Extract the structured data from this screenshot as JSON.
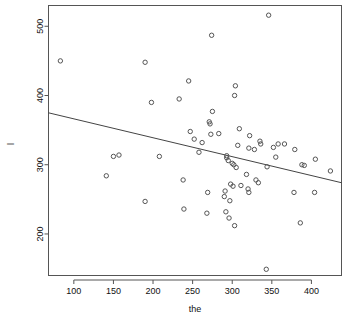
{
  "chart_data": {
    "type": "scatter",
    "title": "",
    "xlabel": "the",
    "ylabel": "l",
    "xlim": [
      68,
      438
    ],
    "ylim": [
      140,
      530
    ],
    "grid": false,
    "legend": null,
    "xticks": [
      100,
      150,
      200,
      250,
      300,
      350,
      400
    ],
    "yticks": [
      200,
      300,
      400,
      500
    ],
    "xticklabels": [
      "100",
      "150",
      "200",
      "250",
      "300",
      "350",
      "400"
    ],
    "yticklabels": [
      "200",
      "300",
      "400",
      "500"
    ],
    "marker": "open-circle",
    "marker_color": "#555555",
    "line_color": "#444444",
    "axis_color": "#555555",
    "series": [
      {
        "name": "observations",
        "points": [
          [
            83,
            450
          ],
          [
            141,
            284
          ],
          [
            150,
            312
          ],
          [
            157,
            314
          ],
          [
            190,
            448
          ],
          [
            190,
            247
          ],
          [
            198,
            390
          ],
          [
            208,
            312
          ],
          [
            233,
            395
          ],
          [
            238,
            278
          ],
          [
            239,
            236
          ],
          [
            245,
            421
          ],
          [
            247,
            348
          ],
          [
            252,
            337
          ],
          [
            258,
            318
          ],
          [
            262,
            332
          ],
          [
            268,
            230
          ],
          [
            269,
            260
          ],
          [
            271,
            362
          ],
          [
            272,
            359
          ],
          [
            273,
            344
          ],
          [
            274,
            487
          ],
          [
            275,
            377
          ],
          [
            283,
            345
          ],
          [
            290,
            254
          ],
          [
            291,
            262
          ],
          [
            292,
            232
          ],
          [
            293,
            313
          ],
          [
            293,
            310
          ],
          [
            295,
            306
          ],
          [
            296,
            223
          ],
          [
            297,
            248
          ],
          [
            298,
            272
          ],
          [
            300,
            302
          ],
          [
            301,
            269
          ],
          [
            302,
            300
          ],
          [
            303,
            400
          ],
          [
            303,
            212
          ],
          [
            304,
            414
          ],
          [
            305,
            296
          ],
          [
            307,
            328
          ],
          [
            309,
            352
          ],
          [
            311,
            270
          ],
          [
            318,
            286
          ],
          [
            320,
            265
          ],
          [
            321,
            324
          ],
          [
            321,
            260
          ],
          [
            322,
            342
          ],
          [
            328,
            322
          ],
          [
            330,
            278
          ],
          [
            333,
            274
          ],
          [
            335,
            334
          ],
          [
            336,
            330
          ],
          [
            343,
            149
          ],
          [
            344,
            297
          ],
          [
            346,
            516
          ],
          [
            352,
            325
          ],
          [
            355,
            311
          ],
          [
            358,
            330
          ],
          [
            366,
            330
          ],
          [
            378,
            260
          ],
          [
            379,
            322
          ],
          [
            386,
            216
          ],
          [
            388,
            300
          ],
          [
            391,
            299
          ],
          [
            404,
            260
          ],
          [
            405,
            308
          ],
          [
            424,
            291
          ]
        ]
      }
    ],
    "fit_line": {
      "name": "regression-line",
      "x_start": 68,
      "y_start": 375,
      "x_end": 438,
      "y_end": 274
    }
  }
}
